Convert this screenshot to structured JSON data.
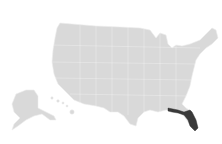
{
  "map": {
    "type": "choropleth",
    "region": "United States",
    "base_color": "#d9d9d9",
    "highlight_color": "#3a3a3a",
    "background": "#ffffff",
    "highlighted_states": [
      "Florida"
    ],
    "shapes": {
      "contiguous": "M60,23 L72,24 L96,26 L120,27 L140,28 L150,30 L156,38 L160,33 L166,35 L168,44 L172,48 L176,45 L182,46 L190,44 L200,40 L206,34 L212,28 L216,30 L218,38 L212,44 L206,48 L200,54 L196,60 L194,68 L192,76 L190,86 L186,96 L182,104 L186,108 L192,112 L196,120 L198,128 L194,130 L188,122 L184,116 L178,112 L172,110 L166,110 L158,112 L150,110 L144,112 L138,118 L136,126 L130,124 L124,116 L118,112 L110,112 L104,108 L96,106 L84,104 L74,100 L66,92 L58,84 L54,74 L52,62 L53,50 L55,38 L57,28 Z",
      "florida": "M168,108 L178,110 L184,112 L190,110 L192,112 L196,120 L198,128 L195,131 L190,126 L188,120 L184,115 L178,113 L172,112 L168,111 Z",
      "alaska": "M16,94 L26,90 L34,90 L38,96 L38,108 L46,112 L54,116 L56,120 L50,120 L42,114 L34,116 L26,120 L18,126 L12,130 L14,124 L20,118 L14,112 L12,104 Z",
      "hawaii": [
        {
          "cx": 52,
          "cy": 98,
          "r": 1.2
        },
        {
          "cx": 58,
          "cy": 101,
          "r": 1.3
        },
        {
          "cx": 63,
          "cy": 103,
          "r": 1.1
        },
        {
          "cx": 67,
          "cy": 106,
          "r": 1.0
        },
        {
          "cx": 72,
          "cy": 112,
          "r": 2.2
        }
      ]
    }
  }
}
